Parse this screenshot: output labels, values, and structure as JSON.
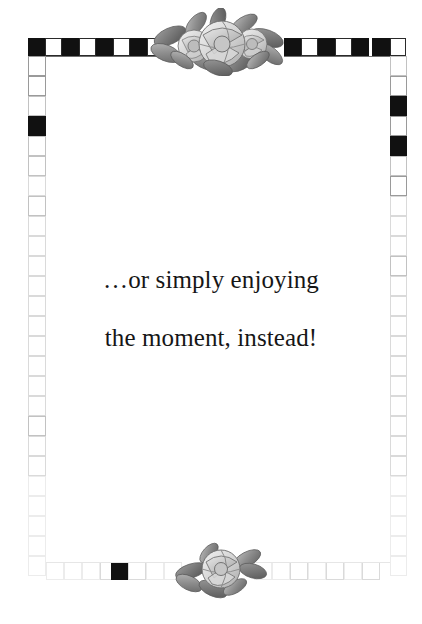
{
  "page": {
    "width": 422,
    "height": 624,
    "background_color": "#ffffff",
    "kind": "decorative-stationery-page"
  },
  "message": {
    "line1": "…or simply enjoying",
    "line2": "the moment, instead!",
    "full_text": "…or simply enjoying the moment, instead!",
    "color": "#161616",
    "align": "center"
  },
  "ornaments": {
    "top_floral": {
      "name": "rose-cluster-top",
      "description": "grayscale watercolor cluster of three roses with leaves"
    },
    "bottom_floral": {
      "name": "rose-cluster-bottom",
      "description": "grayscale watercolor single rose with leaves"
    }
  },
  "border": {
    "style": "checkerboard",
    "black_color": "#111111",
    "white_color": "#ffffff",
    "outline_color": "#9a9a9a",
    "top_band": {
      "label": "top checkerboard band",
      "cells_left": [
        "black",
        "white",
        "black",
        "white",
        "black",
        "white",
        "black"
      ],
      "cells_right": [
        "white",
        "black",
        "white",
        "black",
        "white",
        "black",
        "white",
        "black",
        "white"
      ]
    },
    "left_band": {
      "label": "left checkerboard band",
      "accent_cells": [
        1
      ]
    },
    "right_band": {
      "label": "right checkerboard band",
      "accent_cells": [
        1,
        3
      ]
    },
    "bottom_band": {
      "label": "bottom checkerboard band",
      "accent_cells": [
        4
      ]
    }
  }
}
